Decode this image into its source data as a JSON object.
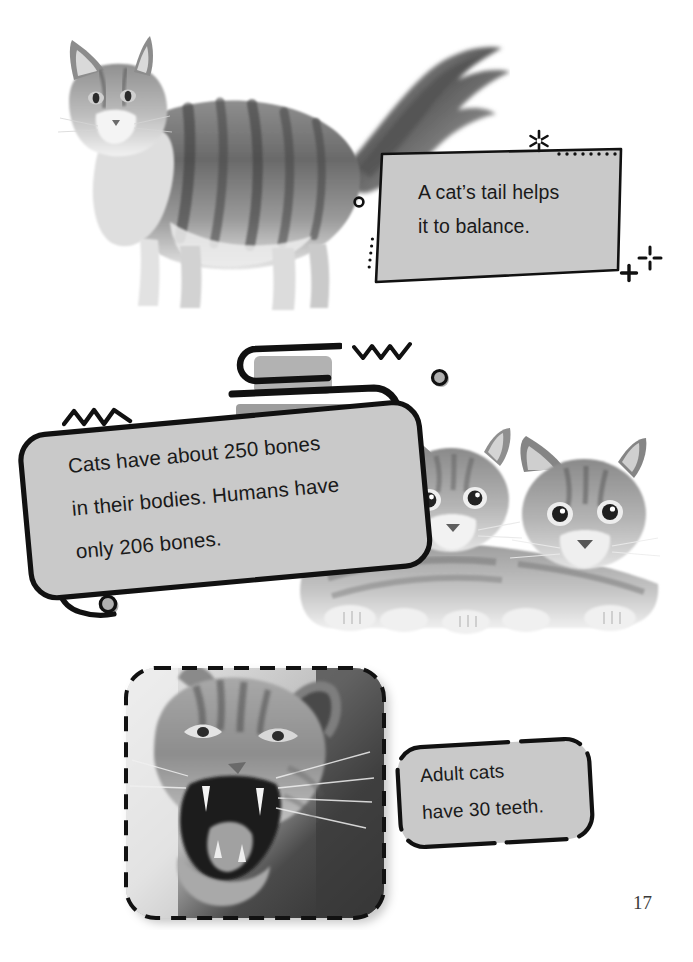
{
  "page": {
    "number": "17",
    "background_color": "#ffffff",
    "ink_color": "#111111",
    "bubble_fill_color": "#c9c9c9",
    "bubble_stroke_color": "#111111"
  },
  "callouts": [
    {
      "id": "tail-balance",
      "name": "callout-tail-balance",
      "shape": "skewed-quadrilateral",
      "lines": [
        "A cat’s tail helps",
        "it to balance."
      ],
      "line1": "A cat’s tail helps",
      "line2": "it to balance."
    },
    {
      "id": "bones",
      "name": "callout-bones",
      "shape": "rounded-rect-with-tail",
      "lines": [
        "Cats have about 250 bones",
        "in their bodies. Humans have",
        "only 206 bones."
      ],
      "line1": "Cats have about 250 bones",
      "line2": "in their bodies. Humans have",
      "line3": "only 206 bones."
    },
    {
      "id": "teeth",
      "name": "callout-teeth",
      "shape": "dashed-rounded-rect",
      "lines": [
        "Adult cats",
        "have 30 teeth."
      ],
      "line1": "Adult cats",
      "line2": "have 30 teeth."
    }
  ],
  "photos": [
    {
      "id": "longhair-cat",
      "name": "photo-longhair-cat-standing",
      "description": "Long-haired tabby cat standing in profile with a large bushy tail raised",
      "style": "grayscale cut-out on white"
    },
    {
      "id": "two-kittens",
      "name": "photo-two-kittens",
      "description": "Two tabby kittens lying side by side facing the viewer",
      "style": "grayscale cut-out on white"
    },
    {
      "id": "yawning-cat",
      "name": "photo-yawning-cat",
      "description": "Close-up of a tabby cat yawning with mouth wide open showing teeth",
      "style": "grayscale photo in rounded square frame with dashed border"
    }
  ],
  "decorations": [
    {
      "name": "sparkle-asterisk-icon",
      "glyph": "asterisk-burst"
    },
    {
      "name": "dotted-line-icon",
      "glyph": "dots-horizontal"
    },
    {
      "name": "dotted-line-vertical-icon",
      "glyph": "dots-vertical"
    },
    {
      "name": "ring-small-icon",
      "glyph": "ring"
    },
    {
      "name": "plus-icon",
      "glyph": "plus"
    },
    {
      "name": "sparkle-four-point-icon",
      "glyph": "four-spoke"
    },
    {
      "name": "zigzag-icon",
      "glyph": "zigzag"
    },
    {
      "name": "zigzag-icon",
      "glyph": "zigzag"
    },
    {
      "name": "ring-grey-icon",
      "glyph": "ring-filled"
    },
    {
      "name": "ring-grey-icon",
      "glyph": "ring-filled"
    },
    {
      "name": "capsule-shape-icon",
      "glyph": "pill-outline"
    },
    {
      "name": "capsule-shape-icon",
      "glyph": "pill-outline"
    }
  ]
}
